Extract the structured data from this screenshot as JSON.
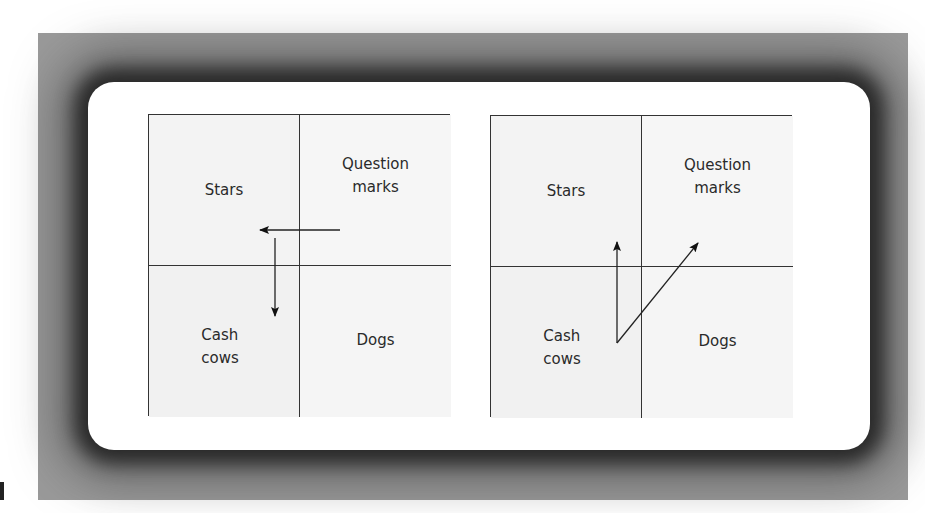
{
  "figure": {
    "colors": {
      "frame": "#9a9a9a",
      "card": "#ffffff",
      "lines": "#333333",
      "text": "#2a2a2a"
    }
  },
  "matrices": [
    {
      "id": "left",
      "quadrants": {
        "top_left": "Stars",
        "top_right": "Question\nmarks",
        "bottom_left": "Cash\ncows",
        "bottom_right": "Dogs"
      },
      "arrows": [
        {
          "from": "Question marks",
          "to": "Stars",
          "direction": "left"
        },
        {
          "from": "Stars",
          "to": "Cash cows",
          "direction": "down"
        }
      ]
    },
    {
      "id": "right",
      "quadrants": {
        "top_left": "Stars",
        "top_right": "Question\nmarks",
        "bottom_left": "Cash\ncows",
        "bottom_right": "Dogs"
      },
      "arrows": [
        {
          "from": "Cash cows",
          "to": "Stars",
          "direction": "up"
        },
        {
          "from": "Cash cows",
          "to": "Question marks",
          "direction": "up-right"
        }
      ]
    }
  ]
}
